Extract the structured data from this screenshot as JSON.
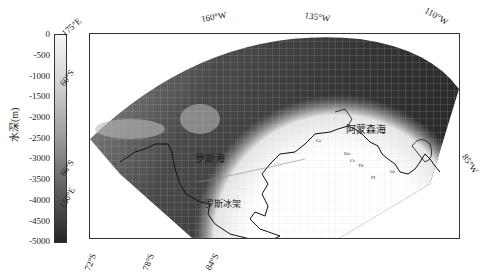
{
  "colorbar": {
    "label": "水深(m)",
    "ticks": [
      "0",
      "-500",
      "-1000",
      "-1500",
      "-2000",
      "-2500",
      "-3000",
      "-3500",
      "-4000",
      "-4500",
      "-5000"
    ],
    "min": -5000,
    "max": 0,
    "color_top": "#f4f4f4",
    "color_bottom": "#2a2a2a"
  },
  "axes": {
    "top_labels": [
      "175°E",
      "160°W",
      "135°W",
      "110°W"
    ],
    "left_labels": [
      "60°S",
      "66°S",
      "150°E"
    ],
    "right_labels": [
      "85°W"
    ],
    "bottom_labels": [
      "72°S",
      "78°S",
      "84°S"
    ]
  },
  "regions": {
    "ross_sea": "罗斯海",
    "ross_ice_shelf": "罗斯冰架",
    "amundsen_sea": "阿蒙森海"
  },
  "small_labels": [
    "Ge",
    "Do",
    "Cr",
    "Th",
    "PI",
    "Ab"
  ]
}
